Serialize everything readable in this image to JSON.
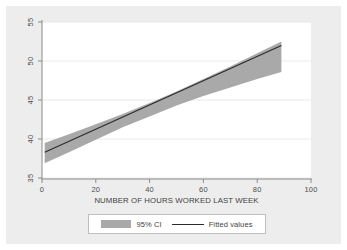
{
  "chart_data": {
    "type": "line",
    "title": "",
    "xlabel": "NUMBER OF HOURS WORKED LAST WEEK",
    "ylabel": "",
    "xlim": [
      0,
      100
    ],
    "ylim": [
      35,
      55
    ],
    "xticks": [
      0,
      20,
      40,
      60,
      80,
      100
    ],
    "yticks": [
      35,
      40,
      45,
      50,
      55
    ],
    "xtick_labels": [
      "0",
      "20",
      "40",
      "60",
      "80",
      "100"
    ],
    "ytick_labels": [
      "35",
      "40",
      "45",
      "50",
      "55"
    ],
    "grid": "horizontal",
    "legend_position": "below-plot",
    "series": [
      {
        "name": "95% CI",
        "type": "area",
        "color": "#a9a9a9",
        "x": [
          1,
          10,
          20,
          30,
          40,
          50,
          60,
          70,
          80,
          89
        ],
        "lower": [
          36.9,
          38.3,
          39.9,
          41.5,
          42.9,
          44.3,
          45.5,
          46.6,
          47.7,
          48.6
        ],
        "upper": [
          39.5,
          40.6,
          41.9,
          43.2,
          44.6,
          46.1,
          47.7,
          49.3,
          51.0,
          52.5
        ]
      },
      {
        "name": "Fitted values",
        "type": "line",
        "color": "#2b2b2b",
        "x": [
          1,
          89
        ],
        "values": [
          38.3,
          52.0
        ]
      }
    ]
  },
  "legend": {
    "entries": [
      {
        "label": "95% CI",
        "marker": "swatch",
        "color": "#a9a9a9"
      },
      {
        "label": "Fitted values",
        "marker": "line",
        "color": "#2b2b2b"
      }
    ]
  },
  "axis": {
    "x_title": "NUMBER OF HOURS WORKED LAST WEEK"
  },
  "colors": {
    "graph_background": "#ededed",
    "plot_background": "#ffffff",
    "ci_band": "#a9a9a9",
    "fit_line": "#2b2b2b",
    "axis_line": "#8c8c8c",
    "gridline": "#e4e4e4",
    "tick_text": "#4d4d4d"
  }
}
